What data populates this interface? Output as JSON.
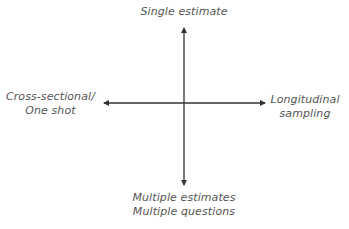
{
  "diagram": {
    "type": "quadrant-axes",
    "colors": {
      "axis": "#333333",
      "text": "#555555",
      "background": "#ffffff"
    },
    "axes": {
      "vertical": {
        "top_label": "Single estimate",
        "bottom_label": {
          "line1": "Multiple estimates",
          "line2": "Multiple questions"
        }
      },
      "horizontal": {
        "left_label": {
          "line1": "Cross-sectional/",
          "line2": "One shot"
        },
        "right_label": {
          "line1": "Longitudinal",
          "line2": "sampling"
        }
      }
    }
  }
}
